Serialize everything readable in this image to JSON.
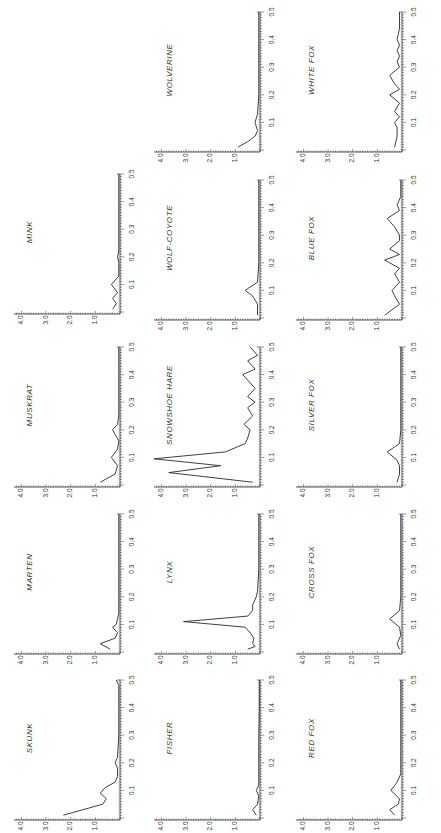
{
  "figure": {
    "orientation": "rotated-90-ccw",
    "ink_color": "#2a2a2a",
    "background": "#ffffff"
  },
  "chart_data": [
    {
      "type": "line",
      "title": "SKUNK",
      "xlabel": "",
      "ylabel": "",
      "xlim": [
        0,
        0.5
      ],
      "ylim": [
        0,
        4.0
      ],
      "xticks": [
        "0.1",
        "0.2",
        "0.3",
        "0.4",
        "0.5"
      ],
      "yticks": [
        "1.0",
        "2.0",
        "3.0",
        "4.0"
      ],
      "x": [
        0.01,
        0.03,
        0.05,
        0.07,
        0.09,
        0.11,
        0.13,
        0.15,
        0.18,
        0.2,
        0.22,
        0.3,
        0.4,
        0.48,
        0.5
      ],
      "values": [
        2.3,
        1.5,
        0.7,
        0.55,
        0.8,
        0.6,
        0.2,
        0.1,
        0.1,
        0.2,
        0.1,
        0.05,
        0.05,
        0.05,
        0.15
      ]
    },
    {
      "type": "line",
      "title": "MARTEN",
      "xlim": [
        0,
        0.5
      ],
      "ylim": [
        0,
        4.0
      ],
      "xticks": [
        "0.1",
        "0.2",
        "0.3",
        "0.4",
        "0.5"
      ],
      "yticks": [
        "1.0",
        "2.0",
        "3.0",
        "4.0"
      ],
      "x": [
        0.01,
        0.03,
        0.05,
        0.07,
        0.09,
        0.1,
        0.12,
        0.14,
        0.2,
        0.3,
        0.4,
        0.5
      ],
      "values": [
        0.4,
        0.8,
        0.2,
        0.1,
        0.3,
        0.15,
        0.1,
        0.05,
        0.05,
        0.05,
        0.05,
        0.05
      ]
    },
    {
      "type": "line",
      "title": "MUSKRAT",
      "xlim": [
        0,
        0.5
      ],
      "ylim": [
        0,
        4.0
      ],
      "xticks": [
        "0.1",
        "0.2",
        "0.3",
        "0.4",
        "0.5"
      ],
      "yticks": [
        "1.0",
        "2.0",
        "3.0",
        "4.0"
      ],
      "x": [
        0.01,
        0.04,
        0.07,
        0.1,
        0.13,
        0.16,
        0.2,
        0.22,
        0.25,
        0.3,
        0.4,
        0.5
      ],
      "values": [
        0.8,
        0.2,
        0.1,
        0.35,
        0.1,
        0.05,
        0.3,
        0.1,
        0.05,
        0.05,
        0.05,
        0.05
      ]
    },
    {
      "type": "line",
      "title": "MINK",
      "xlim": [
        0,
        0.5
      ],
      "ylim": [
        0,
        4.0
      ],
      "xticks": [
        "0.1",
        "0.2",
        "0.3",
        "0.4",
        "0.5"
      ],
      "yticks": [
        "1.0",
        "2.0",
        "3.0",
        "4.0"
      ],
      "x": [
        0.01,
        0.03,
        0.05,
        0.07,
        0.1,
        0.13,
        0.18,
        0.2,
        0.22,
        0.3,
        0.4,
        0.5
      ],
      "values": [
        0.3,
        0.15,
        0.3,
        0.1,
        0.35,
        0.05,
        0.05,
        0.1,
        0.05,
        0.05,
        0.05,
        0.05
      ]
    },
    {
      "type": "line",
      "title": "FISHER",
      "xlim": [
        0,
        0.5
      ],
      "ylim": [
        0,
        4.0
      ],
      "xticks": [
        "0.1",
        "0.2",
        "0.3",
        "0.4",
        "0.5"
      ],
      "yticks": [
        "1.0",
        "2.0",
        "3.0",
        "4.0"
      ],
      "x": [
        0.01,
        0.03,
        0.05,
        0.08,
        0.1,
        0.12,
        0.15,
        0.2,
        0.3,
        0.4,
        0.5
      ],
      "values": [
        0.15,
        0.3,
        0.1,
        0.05,
        0.15,
        0.05,
        0.05,
        0.05,
        0.05,
        0.03,
        0.03
      ]
    },
    {
      "type": "line",
      "title": "LYNX",
      "xlim": [
        0,
        0.5
      ],
      "ylim": [
        0,
        4.0
      ],
      "xticks": [
        "0.1",
        "0.2",
        "0.3",
        "0.4",
        "0.5"
      ],
      "yticks": [
        "1.0",
        "2.0",
        "3.0",
        "4.0"
      ],
      "x": [
        0.01,
        0.02,
        0.03,
        0.05,
        0.07,
        0.09,
        0.11,
        0.13,
        0.15,
        0.17,
        0.2,
        0.22,
        0.3,
        0.4,
        0.5
      ],
      "values": [
        0.5,
        0.2,
        0.3,
        0.25,
        0.4,
        0.6,
        3.1,
        0.5,
        0.3,
        0.3,
        0.15,
        0.1,
        0.05,
        0.05,
        0.05
      ]
    },
    {
      "type": "line",
      "title": "SNOWSHOE HARE",
      "xlim": [
        0,
        0.5
      ],
      "ylim": [
        0,
        4.0
      ],
      "xticks": [
        "0.1",
        "0.2",
        "0.3",
        "0.4",
        "0.5"
      ],
      "yticks": [
        "1.0",
        "2.0",
        "3.0",
        "4.0"
      ],
      "x": [
        0.01,
        0.045,
        0.07,
        0.095,
        0.12,
        0.15,
        0.17,
        0.2,
        0.22,
        0.25,
        0.28,
        0.3,
        0.32,
        0.35,
        0.38,
        0.4,
        0.42,
        0.45,
        0.47,
        0.5
      ],
      "values": [
        0.3,
        3.7,
        1.6,
        4.3,
        1.4,
        0.6,
        0.5,
        0.4,
        0.65,
        0.3,
        0.5,
        0.2,
        0.5,
        0.2,
        0.5,
        0.7,
        0.2,
        0.5,
        0.1,
        0.4
      ]
    },
    {
      "type": "line",
      "title": "WOLF-COYOTE",
      "xlim": [
        0,
        0.5
      ],
      "ylim": [
        0,
        4.0
      ],
      "xticks": [
        "0.1",
        "0.2",
        "0.3",
        "0.4",
        "0.5"
      ],
      "yticks": [
        "1.0",
        "2.0",
        "3.0",
        "4.0"
      ],
      "x": [
        0.01,
        0.05,
        0.08,
        0.1,
        0.13,
        0.2,
        0.3,
        0.4,
        0.5
      ],
      "values": [
        0.1,
        0.1,
        0.3,
        0.6,
        0.1,
        0.05,
        0.05,
        0.05,
        0.05
      ]
    },
    {
      "type": "line",
      "title": "WOLVERINE",
      "xlim": [
        0,
        0.5
      ],
      "ylim": [
        0,
        4.0
      ],
      "xticks": [
        "0.1",
        "0.2",
        "0.3",
        "0.4",
        "0.5"
      ],
      "yticks": [
        "1.0",
        "2.0",
        "3.0",
        "4.0"
      ],
      "x": [
        0.01,
        0.03,
        0.05,
        0.07,
        0.1,
        0.13,
        0.2,
        0.3,
        0.4,
        0.5
      ],
      "values": [
        0.9,
        0.5,
        0.2,
        0.1,
        0.2,
        0.1,
        0.05,
        0.05,
        0.05,
        0.05
      ]
    },
    {
      "type": "line",
      "title": "RED FOX",
      "xlim": [
        0,
        0.5
      ],
      "ylim": [
        0,
        4.0
      ],
      "xticks": [
        "0.1",
        "0.2",
        "0.3",
        "0.4",
        "0.5"
      ],
      "yticks": [
        "1.0",
        "2.0",
        "3.0",
        "4.0"
      ],
      "x": [
        0.01,
        0.03,
        0.05,
        0.07,
        0.1,
        0.13,
        0.16,
        0.2,
        0.3,
        0.4,
        0.5
      ],
      "values": [
        0.3,
        0.5,
        0.15,
        0.1,
        0.45,
        0.2,
        0.05,
        0.05,
        0.05,
        0.05,
        0.05
      ]
    },
    {
      "type": "line",
      "title": "CROSS FOX",
      "xlim": [
        0,
        0.5
      ],
      "ylim": [
        0,
        4.0
      ],
      "xticks": [
        "0.1",
        "0.2",
        "0.3",
        "0.4",
        "0.5"
      ],
      "yticks": [
        "1.0",
        "2.0",
        "3.0",
        "4.0"
      ],
      "x": [
        0.01,
        0.03,
        0.06,
        0.09,
        0.12,
        0.15,
        0.2,
        0.3,
        0.4,
        0.5
      ],
      "values": [
        0.1,
        0.2,
        0.05,
        0.1,
        0.5,
        0.1,
        0.05,
        0.05,
        0.05,
        0.05
      ]
    },
    {
      "type": "line",
      "title": "SILVER FOX",
      "xlim": [
        0,
        0.5
      ],
      "ylim": [
        0,
        4.0
      ],
      "xticks": [
        "0.1",
        "0.2",
        "0.3",
        "0.4",
        "0.5"
      ],
      "yticks": [
        "1.0",
        "2.0",
        "3.0",
        "4.0"
      ],
      "x": [
        0.01,
        0.04,
        0.07,
        0.09,
        0.12,
        0.15,
        0.2,
        0.3,
        0.4,
        0.5
      ],
      "values": [
        0.2,
        0.1,
        0.1,
        0.2,
        0.6,
        0.1,
        0.05,
        0.05,
        0.05,
        0.05
      ]
    },
    {
      "type": "line",
      "title": "BLUE FOX",
      "xlim": [
        0,
        0.5
      ],
      "ylim": [
        0,
        4.0
      ],
      "xticks": [
        "0.1",
        "0.2",
        "0.3",
        "0.4",
        "0.5"
      ],
      "yticks": [
        "1.0",
        "2.0",
        "3.0",
        "4.0"
      ],
      "x": [
        0.01,
        0.05,
        0.08,
        0.1,
        0.13,
        0.16,
        0.18,
        0.21,
        0.23,
        0.25,
        0.28,
        0.3,
        0.33,
        0.36,
        0.39,
        0.41,
        0.44,
        0.5
      ],
      "values": [
        0.7,
        0.1,
        0.3,
        0.4,
        0.1,
        0.3,
        0.1,
        0.7,
        0.1,
        0.5,
        0.1,
        0.1,
        0.3,
        0.6,
        0.1,
        0.2,
        0.05,
        0.05
      ]
    },
    {
      "type": "line",
      "title": "WHITE FOX",
      "xlim": [
        0,
        0.5
      ],
      "ylim": [
        0,
        4.0
      ],
      "xticks": [
        "0.1",
        "0.2",
        "0.3",
        "0.4",
        "0.5"
      ],
      "yticks": [
        "1.0",
        "2.0",
        "3.0",
        "4.0"
      ],
      "x": [
        0.01,
        0.05,
        0.08,
        0.1,
        0.12,
        0.14,
        0.17,
        0.2,
        0.22,
        0.24,
        0.27,
        0.3,
        0.32,
        0.34,
        0.36,
        0.38,
        0.4,
        0.44,
        0.5
      ],
      "values": [
        0.3,
        0.2,
        0.2,
        0.3,
        0.1,
        0.3,
        0.1,
        0.5,
        0.1,
        0.3,
        0.5,
        0.1,
        0.2,
        0.1,
        0.2,
        0.1,
        0.2,
        0.1,
        0.1
      ]
    }
  ],
  "layout": {
    "panels": [
      {
        "idx": 3,
        "x": 0,
        "y": 162,
        "name": "panel-mink"
      },
      {
        "idx": 2,
        "x": 0,
        "y": 335,
        "name": "panel-muskrat"
      },
      {
        "idx": 1,
        "x": 0,
        "y": 502,
        "name": "panel-marten"
      },
      {
        "idx": 0,
        "x": 0,
        "y": 668,
        "name": "panel-skunk"
      },
      {
        "idx": 8,
        "x": 140,
        "y": 0,
        "name": "panel-wolverine"
      },
      {
        "idx": 7,
        "x": 140,
        "y": 168,
        "name": "panel-wolf-coyote"
      },
      {
        "idx": 6,
        "x": 140,
        "y": 335,
        "name": "panel-snowshoe-hare"
      },
      {
        "idx": 5,
        "x": 140,
        "y": 502,
        "name": "panel-lynx"
      },
      {
        "idx": 4,
        "x": 140,
        "y": 668,
        "name": "panel-fisher"
      },
      {
        "idx": 13,
        "x": 282,
        "y": 0,
        "name": "panel-white-fox"
      },
      {
        "idx": 12,
        "x": 282,
        "y": 168,
        "name": "panel-blue-fox"
      },
      {
        "idx": 11,
        "x": 282,
        "y": 335,
        "name": "panel-silver-fox"
      },
      {
        "idx": 10,
        "x": 282,
        "y": 502,
        "name": "panel-cross-fox"
      },
      {
        "idx": 9,
        "x": 282,
        "y": 668,
        "name": "panel-red-fox"
      }
    ]
  }
}
